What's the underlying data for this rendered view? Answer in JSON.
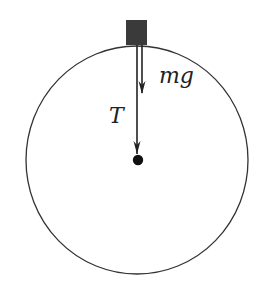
{
  "diagram": {
    "labels": {
      "weight": "mg",
      "tension": "T"
    },
    "elements": {
      "circle": {
        "cx": 137,
        "cy": 160,
        "rx": 111,
        "ry": 114,
        "stroke": "#333333"
      },
      "mass_block": {
        "x": 126,
        "y": 20,
        "w": 21,
        "h": 25,
        "fill": "#3a3a3a"
      },
      "center_pivot": {
        "cx": 138,
        "cy": 160,
        "r": 5,
        "fill": "#111111"
      },
      "tension_arrow": {
        "x": 137,
        "y1": 45,
        "y2": 154
      },
      "weight_arrow": {
        "x": 142,
        "y1": 45,
        "y2": 94
      }
    },
    "colors": {
      "line": "#222222",
      "block": "#3a3a3a",
      "background": "#ffffff"
    }
  }
}
